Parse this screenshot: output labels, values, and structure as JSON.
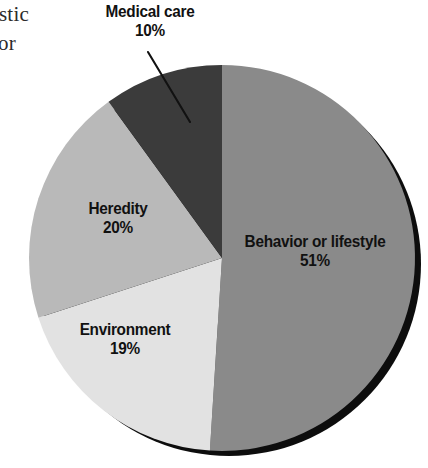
{
  "figure": {
    "name": "causes-of-death-pie-chart",
    "bleed_text": {
      "line1": "stic",
      "line2": "or"
    }
  },
  "chart_data": {
    "type": "pie",
    "title": "",
    "xlabel": "",
    "ylabel": "",
    "legend_position": "none",
    "grid": false,
    "labels_on_slices": true,
    "categories": [
      "Behavior or lifestyle",
      "Environment",
      "Heredity",
      "Medical care"
    ],
    "values": [
      51,
      19,
      20,
      10
    ],
    "value_suffix": "%",
    "slices": [
      {
        "label": "Behavior or lifestyle",
        "value": 51,
        "value_text": "51%",
        "color": "#8a8a8a",
        "start_angle_deg": 0,
        "end_angle_deg": 183.6,
        "label_placement": "inside"
      },
      {
        "label": "Environment",
        "value": 19,
        "value_text": "19%",
        "color": "#e2e2e2",
        "start_angle_deg": 183.6,
        "end_angle_deg": 252.0,
        "label_placement": "inside"
      },
      {
        "label": "Heredity",
        "value": 20,
        "value_text": "20%",
        "color": "#b9b9b9",
        "start_angle_deg": 252.0,
        "end_angle_deg": 324.0,
        "label_placement": "inside"
      },
      {
        "label": "Medical care",
        "value": 10,
        "value_text": "10%",
        "color": "#3b3b3b",
        "start_angle_deg": 324.0,
        "end_angle_deg": 360.0,
        "label_placement": "outside-leader-line"
      }
    ],
    "annotations": [
      {
        "name": "medical-care-leader-line",
        "from_label": "Medical care",
        "color": "#111111"
      }
    ],
    "style": {
      "shadow_color": "#0d0d0d",
      "label_text_color": "#111111",
      "background": "#ffffff"
    }
  }
}
